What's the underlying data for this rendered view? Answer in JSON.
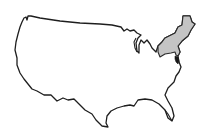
{
  "map": {
    "subject": "contiguous-united-states",
    "highlighted_region": "northeast",
    "colors": {
      "background": "#ffffff",
      "land": "#ffffff",
      "outline": "#1e1e1e",
      "highlight": "#c4c4c4",
      "water_detail": "#1a1a1a"
    }
  }
}
